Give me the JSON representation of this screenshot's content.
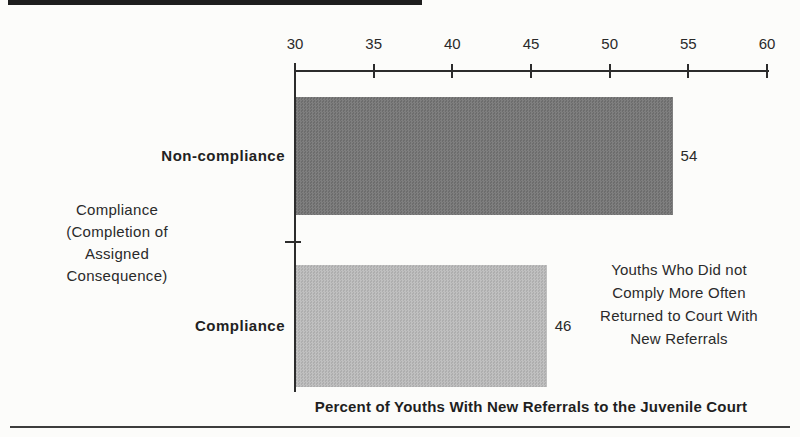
{
  "chart_data": {
    "type": "bar",
    "orientation": "horizontal",
    "categories": [
      "Non-compliance",
      "Compliance"
    ],
    "values": [
      54,
      46
    ],
    "value_labels": [
      "54",
      "46"
    ],
    "x_axis": {
      "min": 30,
      "max": 60,
      "ticks": [
        30,
        35,
        40,
        45,
        50,
        55,
        60
      ],
      "position": "top"
    },
    "xlim": [
      30,
      60
    ],
    "grid": "off",
    "legend": "none",
    "xlabel": "Percent of Youths With New Referrals to the Juvenile Court",
    "ylabel": "Compliance (Completion of Assigned Consequence)",
    "ylabel_lines": [
      "Compliance",
      "(Completion of",
      "Assigned",
      "Consequence)"
    ],
    "annotation": "Youths Who Did not Comply More Often Returned to Court With New Referrals",
    "annotation_lines": [
      "Youths Who Did not",
      "Comply More Often",
      "Returned to Court With",
      "New Referrals"
    ],
    "bar_colors": {
      "non_compliance": "#767676",
      "compliance": "#b7b7b7"
    },
    "axis_color": "#2c2c2c"
  }
}
